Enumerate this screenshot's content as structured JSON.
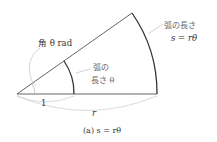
{
  "diagram": {
    "type": "sector-arc-length",
    "labels": {
      "angle": "角 θ rad",
      "inner_arc_line1": "弧の",
      "inner_arc_line2": "長さ θ",
      "outer_arc_line1": "弧の長さ",
      "outer_arc_line2": "s = rθ",
      "unit_radius": "1",
      "radius": "r",
      "caption": "(a)  s = rθ"
    },
    "geometry": {
      "angle_deg": 35,
      "unit_radius_px": 57,
      "outer_radius_px": 140
    },
    "colors": {
      "line": "#333333",
      "pointer": "#bbbbbb",
      "text": "#555555"
    }
  }
}
